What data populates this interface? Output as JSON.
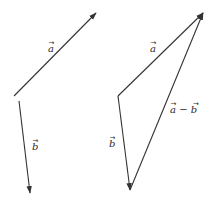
{
  "diagram": {
    "stroke_color": "#333333",
    "left_panel": {
      "vectors": [
        {
          "id": "a",
          "label": "a",
          "x1": 14,
          "y1": 96,
          "x2": 96,
          "y2": 13,
          "label_x": 48,
          "label_y": 52
        },
        {
          "id": "b",
          "label": "b",
          "x1": 19,
          "y1": 101,
          "x2": 30,
          "y2": 193,
          "label_x": 32,
          "label_y": 150
        }
      ]
    },
    "right_panel": {
      "vectors": [
        {
          "id": "a",
          "label": "a",
          "x1": 118,
          "y1": 96,
          "x2": 203,
          "y2": 13,
          "label_x": 150,
          "label_y": 52
        },
        {
          "id": "b",
          "label": "b",
          "x1": 118,
          "y1": 96,
          "x2": 130,
          "y2": 190,
          "label_x": 109,
          "label_y": 147
        },
        {
          "id": "a_minus_b",
          "label": "a − b",
          "x1": 130,
          "y1": 190,
          "x2": 203,
          "y2": 13,
          "label_x": 170,
          "label_y": 113
        }
      ]
    }
  }
}
